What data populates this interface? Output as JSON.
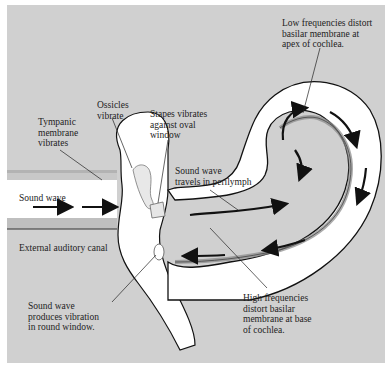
{
  "diagram": {
    "background_color": "#d0d0d0",
    "fluid_color": "#ffffff",
    "line_color": "#111111",
    "labels": {
      "tympanic": "Tympanic\nmembrane\nvibrates",
      "ossicles": "Ossicles\nvibrate",
      "stapes": "Stapes vibrates\nagainst oval\nwindow",
      "low_freq": "Low frequencies distort\nbasilar membrane at\napex of cochlea.",
      "sound_wave_canal": "Sound wave",
      "perilymph": "Sound wave\ntravels in perilymph",
      "external_canal": "External auditory canal",
      "round_window": "Sound wave\nproduces vibration\nin round window.",
      "high_freq": "High frequencies\ndistort basilar\nmembrane at base\nof cochlea."
    },
    "arrows": {
      "canal": [
        "right",
        "right"
      ],
      "upper_scala": [
        "right",
        "up-right",
        "down-right",
        "down"
      ],
      "lower_scala": [
        "left",
        "left",
        "down",
        "up"
      ]
    }
  }
}
